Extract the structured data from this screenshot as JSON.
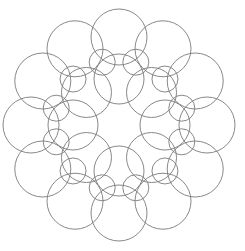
{
  "diagram": {
    "type": "circle-rosette",
    "width": 245,
    "height": 251,
    "background": "#ffffff",
    "stroke_color": "#7a7a7a",
    "center": [
      119,
      125
    ],
    "rings": [
      {
        "name": "outer-large",
        "count": 12,
        "distance": 88,
        "radius": 28,
        "start_angle_deg": 0
      },
      {
        "name": "middle-small",
        "count": 12,
        "distance": 65,
        "radius": 13,
        "start_angle_deg": 15
      },
      {
        "name": "inner-medium",
        "count": 8,
        "distance": 46,
        "radius": 25,
        "start_angle_deg": 0
      }
    ]
  }
}
